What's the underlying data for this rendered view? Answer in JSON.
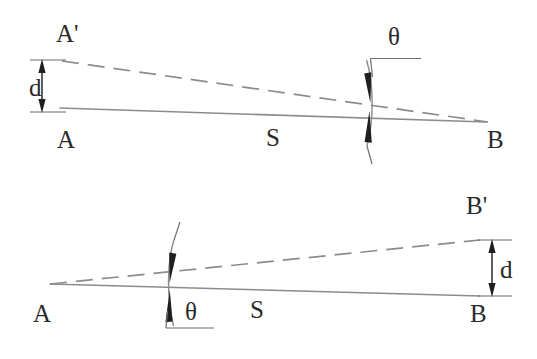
{
  "figure": {
    "background_color": "#ffffff",
    "line_color": "#8c8c8c",
    "label_color": "#2a2a2a",
    "arrow_color": "#1f1f1f"
  },
  "panels": [
    {
      "id": "top",
      "name": "top-panel",
      "labels": {
        "baseline_start": "A",
        "baseline_end": "B",
        "offset_point": "A'",
        "separation": "d",
        "baseline_length": "S",
        "angle": "θ"
      },
      "geometry": {
        "solid_line": {
          "x1": 60,
          "y1": 108,
          "x2": 486,
          "y2": 122
        },
        "dashed_line": {
          "x1": 62,
          "y1": 61,
          "x2": 488,
          "y2": 122
        },
        "dimension": {
          "x": 42,
          "y_top": 60,
          "y_bottom": 112,
          "tick_half_width": 12
        },
        "angle_marker": {
          "x": 368,
          "y_top": 58,
          "y_bottom": 148
        },
        "angle_leader": {
          "x1": 372,
          "y1": 76,
          "x2": 372,
          "y2": 58,
          "x3": 420,
          "y3": 58
        }
      },
      "label_positions": {
        "baseline_start": {
          "x": 57,
          "y": 148
        },
        "baseline_end": {
          "x": 487,
          "y": 148
        },
        "offset_point": {
          "x": 56,
          "y": 42
        },
        "separation": {
          "x": 29,
          "y": 96
        },
        "baseline_length": {
          "x": 266,
          "y": 146
        },
        "angle": {
          "x": 388,
          "y": 45
        }
      }
    },
    {
      "id": "bottom",
      "name": "bottom-panel",
      "labels": {
        "baseline_start": "A",
        "baseline_end": "B",
        "offset_point": "B'",
        "separation": "d",
        "baseline_length": "S",
        "angle": "θ"
      },
      "geometry": {
        "solid_line": {
          "x1": 50,
          "y1": 284,
          "x2": 480,
          "y2": 296
        },
        "dashed_line": {
          "x1": 50,
          "y1": 284,
          "x2": 480,
          "y2": 240
        },
        "dimension": {
          "x": 492,
          "y_top": 240,
          "y_bottom": 296,
          "tick_half_width": 12
        },
        "angle_marker": {
          "x": 172,
          "y_top": 238,
          "y_bottom": 328
        },
        "angle_leader": {
          "x1": 168,
          "y1": 310,
          "x2": 168,
          "y2": 327,
          "x3": 212,
          "y3": 327
        }
      },
      "label_positions": {
        "baseline_start": {
          "x": 33,
          "y": 322
        },
        "baseline_end": {
          "x": 470,
          "y": 322
        },
        "offset_point": {
          "x": 466,
          "y": 214
        },
        "separation": {
          "x": 500,
          "y": 278
        },
        "baseline_length": {
          "x": 250,
          "y": 318
        },
        "angle": {
          "x": 185,
          "y": 320
        }
      }
    }
  ]
}
